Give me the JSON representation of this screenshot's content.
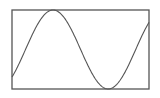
{
  "chart_data": {
    "type": "line",
    "title": "",
    "xlabel": "",
    "ylabel": "",
    "grid": false,
    "legend": null,
    "series": [
      {
        "name": "sine",
        "function": "sin(x)",
        "x_range_rad": [
          -0.77,
          7.04
        ],
        "y_range": [
          -1,
          1
        ],
        "samples": [
          {
            "x": -0.77,
            "y": -0.7
          },
          {
            "x": 0.0,
            "y": 0.0
          },
          {
            "x": 1.571,
            "y": 1.0
          },
          {
            "x": 3.142,
            "y": 0.0
          },
          {
            "x": 4.712,
            "y": -1.0
          },
          {
            "x": 6.283,
            "y": 0.0
          },
          {
            "x": 7.04,
            "y": 0.66
          }
        ]
      }
    ],
    "xlim": [
      -0.77,
      7.04
    ],
    "ylim": [
      -1,
      1
    ],
    "colors": {
      "frame": "#555555",
      "line": "#555555",
      "background": "#ffffff"
    }
  },
  "plot_box": {
    "left": 12,
    "top": 10,
    "right": 149,
    "bottom": 89
  }
}
